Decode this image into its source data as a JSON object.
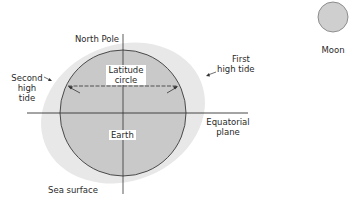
{
  "diagram": {
    "labels": {
      "north_pole": "North Pole",
      "latitude_circle_line1": "Latitude",
      "latitude_circle_line2": "circle",
      "second_high_tide_line1": "Second",
      "second_high_tide_line2": "high",
      "second_high_tide_line3": "tide",
      "first_high_tide_line1": "First",
      "first_high_tide_line2": "high tide",
      "equatorial_plane_line1": "Equatorial",
      "equatorial_plane_line2": "plane",
      "earth": "Earth",
      "sea_surface": "Sea surface",
      "moon": "Moon"
    },
    "colors": {
      "earth_fill": "#c9c9c9",
      "earth_stroke": "#3a3a3a",
      "sea_bulge_fill": "#e6e6e6",
      "moon_fill": "#cfcfcf",
      "line": "#333333",
      "text": "#2a2a2a"
    }
  }
}
